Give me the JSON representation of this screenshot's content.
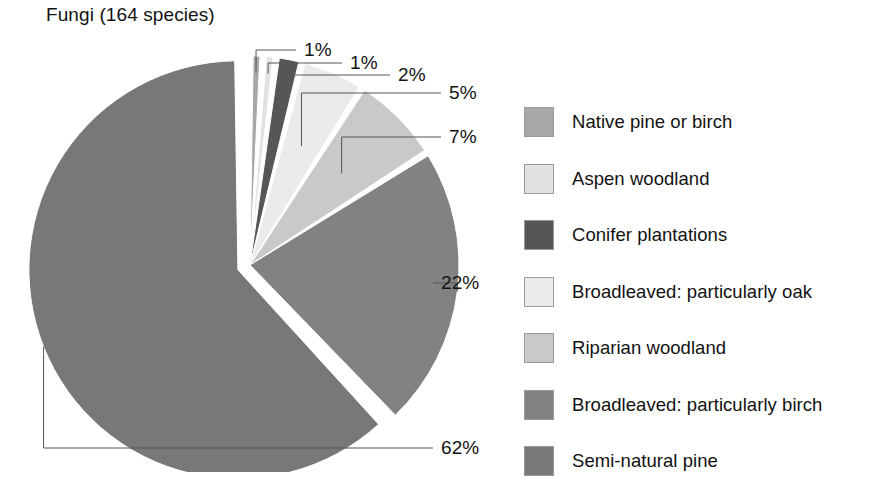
{
  "chart_data": {
    "type": "pie",
    "title": "Fungi (164 species)",
    "xlabel": "",
    "ylabel": "",
    "legend_position": "right",
    "grid": false,
    "total_species": 164,
    "value_unit": "%",
    "categories": [
      "Native pine or birch",
      "Aspen woodland",
      "Conifer plantations",
      "Broadleaved: particularly oak",
      "Riparian woodland",
      "Broadleaved: particularly birch",
      "Semi-natural pine"
    ],
    "values": [
      1,
      1,
      2,
      5,
      7,
      22,
      62
    ],
    "value_labels": [
      "1%",
      "1%",
      "2%",
      "5%",
      "7%",
      "22%",
      "62%"
    ],
    "colors": [
      "#a8a8a8",
      "#e2e2e2",
      "#565656",
      "#ebebeb",
      "#c9c9c9",
      "#828282",
      "#787878"
    ],
    "exploded_slices": [
      "Semi-natural pine"
    ],
    "slices": [
      {
        "label": "Native pine or birch",
        "value": 1,
        "value_label": "1%",
        "color": "#a8a8a8"
      },
      {
        "label": "Aspen woodland",
        "value": 1,
        "value_label": "1%",
        "color": "#e2e2e2"
      },
      {
        "label": "Conifer plantations",
        "value": 2,
        "value_label": "2%",
        "color": "#565656"
      },
      {
        "label": "Broadleaved: particularly oak",
        "value": 5,
        "value_label": "5%",
        "color": "#ebebeb"
      },
      {
        "label": "Riparian woodland",
        "value": 7,
        "value_label": "7%",
        "color": "#c9c9c9"
      },
      {
        "label": "Broadleaved: particularly birch",
        "value": 22,
        "value_label": "22%",
        "color": "#828282"
      },
      {
        "label": "Semi-natural pine",
        "value": 62,
        "value_label": "62%",
        "color": "#787878"
      }
    ]
  },
  "title": {
    "text": "Fungi (164 species)"
  },
  "labels": {
    "pct_1": "1%",
    "pct_2": "1%",
    "pct_3": "2%",
    "pct_4": "5%",
    "pct_5": "7%",
    "pct_6": "22%",
    "pct_7": "62%"
  },
  "legend": {
    "items": [
      {
        "label": "Native pine or birch",
        "color": "#a8a8a8"
      },
      {
        "label": "Aspen woodland",
        "color": "#e2e2e2"
      },
      {
        "label": "Conifer plantations",
        "color": "#565656"
      },
      {
        "label": "Broadleaved: particularly oak",
        "color": "#ebebeb"
      },
      {
        "label": "Riparian woodland",
        "color": "#c9c9c9"
      },
      {
        "label": "Broadleaved: particularly birch",
        "color": "#828282"
      },
      {
        "label": "Semi-natural pine",
        "color": "#787878"
      }
    ]
  }
}
